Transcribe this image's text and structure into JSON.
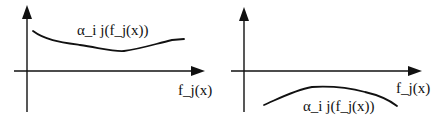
{
  "panels": [
    {
      "id": "left",
      "curve_label": "α_i j(f_j(x))",
      "x_axis_label": "f_j(x)",
      "curve_position": "above x-axis",
      "description": "Curve positive, gently decreasing then slightly rising"
    },
    {
      "id": "right",
      "curve_label": "α_i j(f_j(x))",
      "x_axis_label": "f_j(x)",
      "curve_position": "below x-axis",
      "description": "Curve negative, rising to a hump then falling"
    }
  ],
  "colors": {
    "ink": "#111111",
    "background": "#ffffff"
  }
}
